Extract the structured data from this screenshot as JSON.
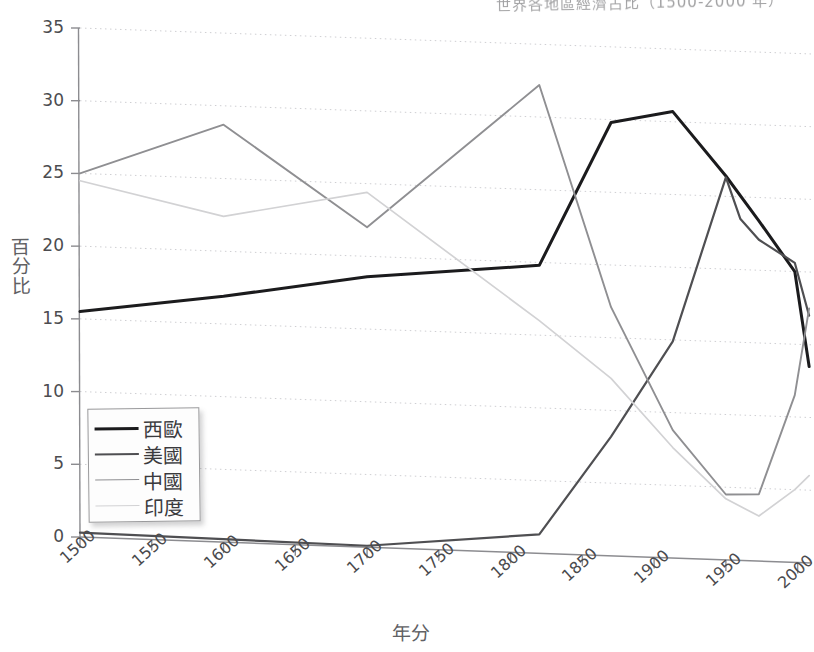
{
  "title": "世界各地區經濟占比（1500-2000 年）",
  "axis": {
    "ylabel": "百分比",
    "xlabel": "年分",
    "yticks": [
      "0",
      "5",
      "10",
      "15",
      "20",
      "25",
      "30",
      "35"
    ],
    "xticks": [
      "1500",
      "1550",
      "1600",
      "1650",
      "1700",
      "1750",
      "1800",
      "1850",
      "1900",
      "1950",
      "2000"
    ]
  },
  "legend": [
    {
      "label": "西歐",
      "color": "#1b1b1d"
    },
    {
      "label": "美國",
      "color": "#4f4f52"
    },
    {
      "label": "中國",
      "color": "#8f8f92"
    },
    {
      "label": "印度",
      "color": "#d2d2d4"
    }
  ],
  "chart_data": {
    "type": "line",
    "title": "世界各地區經濟占比（1500-2000 年）",
    "xlabel": "年分",
    "ylabel": "百分比",
    "xlim": [
      1500,
      2010
    ],
    "ylim": [
      0,
      35
    ],
    "grid": true,
    "legend_position": "lower-left",
    "series": [
      {
        "name": "西歐",
        "color": "#1b1b1d",
        "x": [
          1500,
          1600,
          1700,
          1820,
          1870,
          1913,
          1950,
          1973,
          1998,
          2008
        ],
        "values": [
          15.5,
          16.9,
          18.6,
          19.8,
          29.8,
          30.7,
          26.4,
          23.4,
          20.0,
          13.5
        ]
      },
      {
        "name": "美國",
        "color": "#4f4f52",
        "x": [
          1500,
          1600,
          1700,
          1820,
          1870,
          1913,
          1950,
          1960,
          1973,
          1998,
          2008
        ],
        "values": [
          0.3,
          0.2,
          0.1,
          1.3,
          8.2,
          14.9,
          26.3,
          23.5,
          22.1,
          20.6,
          17.0
        ]
      },
      {
        "name": "中國",
        "color": "#8f8f92",
        "x": [
          1500,
          1600,
          1700,
          1820,
          1870,
          1913,
          1950,
          1973,
          1998,
          2008
        ],
        "values": [
          25.0,
          28.7,
          22.0,
          32.2,
          17.1,
          8.8,
          4.5,
          4.6,
          11.5,
          17.5
        ]
      },
      {
        "name": "印度",
        "color": "#d2d2d4",
        "x": [
          1500,
          1600,
          1700,
          1820,
          1870,
          1913,
          1950,
          1973,
          1998,
          2008
        ],
        "values": [
          24.5,
          22.4,
          24.4,
          16.0,
          12.2,
          7.6,
          4.2,
          3.1,
          5.0,
          6.0
        ]
      }
    ]
  }
}
